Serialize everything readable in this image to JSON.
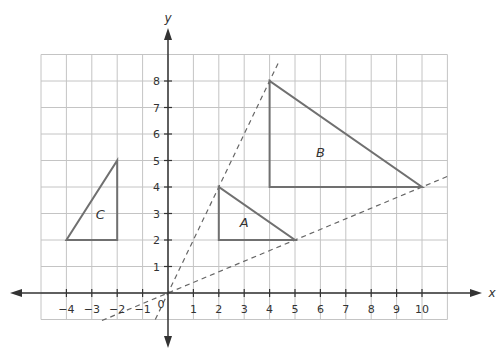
{
  "diagram": {
    "type": "coordinate-plane",
    "axes": {
      "x_label": "x",
      "y_label": "y",
      "x_ticks": [
        "-4",
        "-3",
        "-2",
        "-1",
        "1",
        "2",
        "3",
        "4",
        "5",
        "6",
        "7",
        "8",
        "9",
        "10"
      ],
      "y_ticks": [
        "1",
        "2",
        "3",
        "4",
        "5",
        "6",
        "7",
        "8"
      ],
      "origin_label": "0",
      "x_range": [
        -5,
        11
      ],
      "y_range": [
        -1,
        9
      ]
    },
    "triangles": [
      {
        "label": "A",
        "vertices": [
          [
            2,
            2
          ],
          [
            2,
            4
          ],
          [
            5,
            2
          ]
        ]
      },
      {
        "label": "B",
        "vertices": [
          [
            4,
            4
          ],
          [
            4,
            8
          ],
          [
            10,
            4
          ]
        ]
      },
      {
        "label": "C",
        "vertices": [
          [
            -4,
            2
          ],
          [
            -2,
            2
          ],
          [
            -2,
            5
          ]
        ]
      }
    ],
    "dashed_lines": [
      {
        "name": "line-through-origin-steep",
        "through": [
          [
            0,
            0
          ],
          [
            2,
            4
          ],
          [
            4,
            8
          ]
        ]
      },
      {
        "name": "line-through-origin-shallow",
        "through": [
          [
            0,
            0
          ],
          [
            5,
            2
          ],
          [
            10,
            4
          ]
        ]
      }
    ],
    "colors": {
      "grid": "#c4c4c4",
      "axis": "#333333",
      "shape": "#707070",
      "dashed": "#666666",
      "text": "#333333"
    }
  }
}
